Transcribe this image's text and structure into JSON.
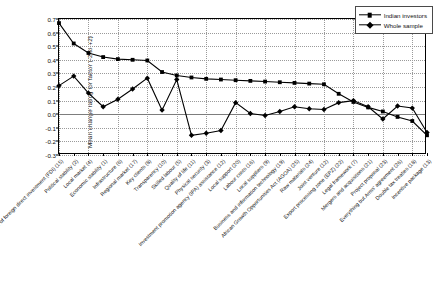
{
  "chart_data": {
    "type": "line",
    "title": "",
    "xlabel": "",
    "ylabel": "Mean change rating for factor (-2 to +2)",
    "ylim": [
      -0.3,
      0.7
    ],
    "yticks": [
      -0.3,
      -0.2,
      -0.1,
      0.0,
      0.1,
      0.2,
      0.3,
      0.4,
      0.5,
      0.6,
      0.7
    ],
    "ytick_labels": [
      "-0.3",
      "-0.2",
      "-0.1",
      "0.0",
      "0.1",
      "0.2",
      "0.3",
      "0.4",
      "0.5",
      "0.6",
      "0.7"
    ],
    "grid": true,
    "legend_position": "top-right",
    "zero_reference_line": 0.0,
    "categories": [
      "Existence of foreign direct investment (FDI) (15)",
      "Political stability (2)",
      "Local market (4)",
      "Economic stability (1)",
      "Infrastructure (6)",
      "Regional market (17)",
      "Key clients (8)",
      "Transparency (10)",
      "Skilled labour (5)",
      "Quality of life (11)",
      "Physical security (3)",
      "Investment promotion agency (IPA) assistance (12)",
      "Local support (20)",
      "Labour costs (16)",
      "Local suppliers (9)",
      "Business and information technology (19)",
      "African Growth Opportunities Act (AGOA) (25)",
      "Raw materials (24)",
      "Joint venture (12)",
      "Export processing zone (EPZ) (22)",
      "Legal framework (7)",
      "Mergers and acquisitions (21)",
      "Project proposal (23)",
      "Everything but Arms' agreement (26)",
      "Double tax treaties (18)",
      "Incentive package (13)"
    ],
    "series": [
      {
        "name": "Indian investors",
        "marker": "square",
        "values": [
          0.67,
          0.52,
          0.45,
          0.42,
          0.405,
          0.4,
          0.395,
          0.31,
          0.285,
          0.27,
          0.26,
          0.255,
          0.25,
          0.245,
          0.24,
          0.235,
          0.23,
          0.225,
          0.22,
          0.15,
          0.09,
          0.05,
          0.02,
          -0.02,
          -0.05,
          -0.155
        ]
      },
      {
        "name": "Whole sample",
        "marker": "diamond",
        "values": [
          0.21,
          0.28,
          0.155,
          0.055,
          0.11,
          0.185,
          0.265,
          0.03,
          0.255,
          -0.155,
          -0.14,
          -0.12,
          0.085,
          0.005,
          -0.01,
          0.02,
          0.055,
          0.04,
          0.035,
          0.085,
          0.1,
          0.055,
          -0.035,
          0.06,
          0.045,
          -0.135
        ]
      }
    ]
  },
  "legend": {
    "items": [
      {
        "label": "Indian investors",
        "marker": "square"
      },
      {
        "label": "Whole sample",
        "marker": "diamond"
      }
    ]
  }
}
